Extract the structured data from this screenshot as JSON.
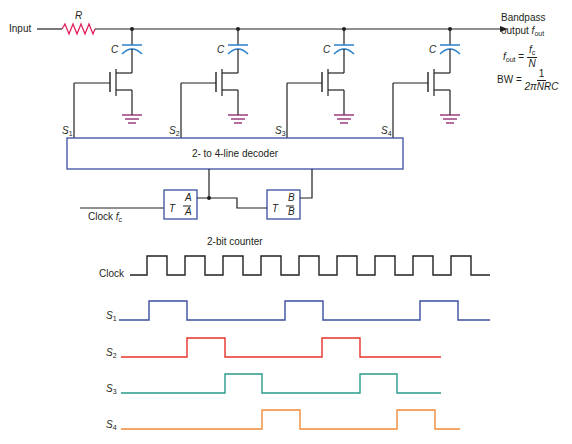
{
  "circuit": {
    "input_label": "Input",
    "resistor_label": "R",
    "capacitor_label": "C",
    "output_label_line1": "Bandpass",
    "output_label_line2": "output",
    "output_symbol": "f",
    "output_sub": "out",
    "stages": [
      {
        "select": "S",
        "select_sub": "1"
      },
      {
        "select": "S",
        "select_sub": "2"
      },
      {
        "select": "S",
        "select_sub": "3"
      },
      {
        "select": "S",
        "select_sub": "4"
      }
    ],
    "decoder_label": "2- to 4-line decoder",
    "counter_label": "2-bit counter",
    "clock_label": "Clock",
    "clock_symbol": "f",
    "clock_sub": "c",
    "flipflop_a": {
      "input": "T",
      "q": "A",
      "qbar": "A"
    },
    "flipflop_b": {
      "input": "T",
      "q": "B",
      "qbar": "B"
    }
  },
  "equations": {
    "fout_lhs": "f",
    "fout_lhs_sub": "out",
    "equals": "=",
    "fout_num": "f",
    "fout_num_sub": "c",
    "fout_den": "N",
    "bw_lhs": "BW",
    "bw_num": "1",
    "bw_den": "2πNRC"
  },
  "colors": {
    "wire": "#231f20",
    "resistor": "#e0245e",
    "capacitor": "#2a7fc9",
    "ground": "#8b1e6b",
    "box": "#3a4fa0",
    "clock_wave": "#231f20",
    "s1_wave": "#3a4fa0",
    "s2_wave": "#e8322b",
    "s3_wave": "#2a9a8a",
    "s4_wave": "#f08c3a"
  },
  "timing": {
    "signals": [
      {
        "name": "Clock",
        "sub": "",
        "transitions": [
          147,
          167,
          185,
          205,
          223,
          243,
          261,
          281,
          299,
          319,
          337,
          357,
          375,
          395,
          413,
          433,
          451,
          471
        ],
        "start": 130,
        "end": 490
      },
      {
        "name": "S",
        "sub": "1",
        "transitions": [
          149,
          187,
          285,
          323,
          420,
          458
        ],
        "start": 119,
        "end": 490
      },
      {
        "name": "S",
        "sub": "2",
        "transitions": [
          187,
          225,
          322,
          360
        ],
        "start": 121,
        "end": 441
      },
      {
        "name": "S",
        "sub": "3",
        "transitions": [
          225,
          262,
          360,
          397
        ],
        "start": 121,
        "end": 441
      },
      {
        "name": "S",
        "sub": "4",
        "transitions": [
          262,
          300,
          397,
          435
        ],
        "start": 121,
        "end": 460
      }
    ]
  }
}
